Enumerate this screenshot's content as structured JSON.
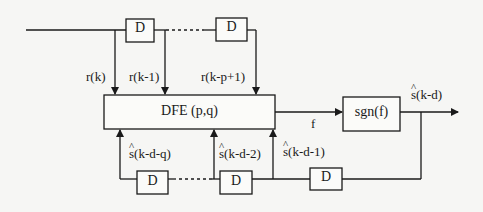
{
  "diagram": {
    "type": "block-diagram",
    "feedforward": {
      "delay_label": "D",
      "ellipsis": "...",
      "taps": [
        {
          "label": "r(k)"
        },
        {
          "label": "r(k-1)"
        },
        {
          "label": "r(k-p+1)"
        }
      ]
    },
    "dfe_block": {
      "label": "DFE (p,q)"
    },
    "signal_f": {
      "label": "f"
    },
    "decision_block": {
      "label": "sgn(f)"
    },
    "output": {
      "symbol": "s",
      "arg": "(k-d)",
      "full": "ŝ(k-d)"
    },
    "feedback": {
      "delay_label": "D",
      "ellipsis": "...",
      "taps": [
        {
          "symbol": "s",
          "arg": "(k-d-q)",
          "full": "ŝ(k-d-q)"
        },
        {
          "symbol": "s",
          "arg": "(k-d-2)",
          "full": "ŝ(k-d-2)"
        },
        {
          "symbol": "s",
          "arg": "(k-d-1)",
          "full": "ŝ(k-d-1)"
        }
      ]
    }
  },
  "colors": {
    "line": "#1a1a1a",
    "background": "#f6f6f4",
    "box_fill": "#fbfbf9"
  }
}
